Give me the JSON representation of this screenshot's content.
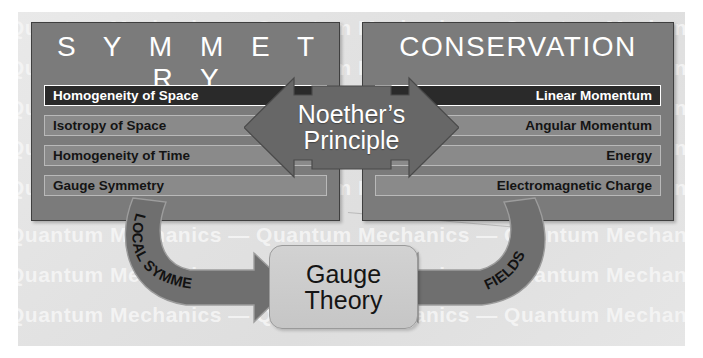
{
  "diagram": {
    "title_left": "S Y M M E T R Y",
    "title_right": "CONSERVATION",
    "center_arrow_line1": "Noether’s",
    "center_arrow_line2": "Principle",
    "bottom_box_line1": "Gauge",
    "bottom_box_line2": "Theory",
    "left_arc_label": "LOCAL SYMMETRY",
    "right_arc_label": "FIELDS",
    "symmetry_items": [
      {
        "label": "Homogeneity of Space",
        "highlighted": true
      },
      {
        "label": "Isotropy of Space",
        "highlighted": false
      },
      {
        "label": "Homogeneity of Time",
        "highlighted": false
      },
      {
        "label": "Gauge Symmetry",
        "highlighted": false
      }
    ],
    "conservation_items": [
      {
        "label": "Linear Momentum",
        "highlighted": true
      },
      {
        "label": "Angular Momentum",
        "highlighted": false
      },
      {
        "label": "Energy",
        "highlighted": false
      },
      {
        "label": "Electromagnetic Charge",
        "highlighted": false
      }
    ],
    "watermark_text": "Quantum  Mechanics  —  Quantum  Mechanics  —  Quantum  Mechanics",
    "watermark_rows": 8,
    "colors": {
      "panel_fill": "#7b7b7b",
      "panel_border": "#3f3f3f",
      "row_fill": "#8a8a8a",
      "row_highlight_fill": "#2a2a2a",
      "arrow_fill": "#6f6f6f",
      "gauge_box_fill": "#cccccc",
      "background": "#e4e4e4",
      "watermark": "#f4f4f4"
    }
  }
}
